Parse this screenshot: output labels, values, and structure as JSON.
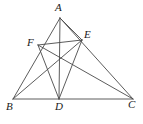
{
  "figure": {
    "kind": "geometry-diagram",
    "width": 143,
    "height": 124,
    "background": "#ffffff",
    "stroke_color": "#4a4a4a",
    "label_color": "#1a1a1a"
  },
  "points": {
    "A": {
      "label": "A",
      "x": 60,
      "y": 18,
      "label_x": 55,
      "label_y": 2
    },
    "B": {
      "label": "B",
      "x": 13,
      "y": 99,
      "label_x": 6,
      "label_y": 101
    },
    "C": {
      "label": "C",
      "x": 133,
      "y": 99,
      "label_x": 128,
      "label_y": 99
    },
    "D": {
      "label": "D",
      "x": 59,
      "y": 99,
      "label_x": 55,
      "label_y": 101
    },
    "E": {
      "label": "E",
      "x": 82,
      "y": 40,
      "label_x": 84,
      "label_y": 29
    },
    "F": {
      "label": "F",
      "x": 38,
      "y": 45,
      "label_x": 27,
      "label_y": 37
    }
  },
  "segments": [
    {
      "name": "side-AB",
      "from": "A",
      "to": "B"
    },
    {
      "name": "side-AC",
      "from": "A",
      "to": "C"
    },
    {
      "name": "side-BC",
      "from": "B",
      "to": "C"
    },
    {
      "name": "cevian-AD",
      "from": "A",
      "to": "D"
    },
    {
      "name": "segment-FE",
      "from": "F",
      "to": "E"
    },
    {
      "name": "segment-FC",
      "from": "F",
      "to": "C"
    },
    {
      "name": "segment-FD",
      "from": "F",
      "to": "D"
    },
    {
      "name": "segment-EB",
      "from": "E",
      "to": "B"
    },
    {
      "name": "segment-ED",
      "from": "E",
      "to": "D"
    },
    {
      "name": "segment-AE",
      "from": "A",
      "to": "E"
    }
  ]
}
